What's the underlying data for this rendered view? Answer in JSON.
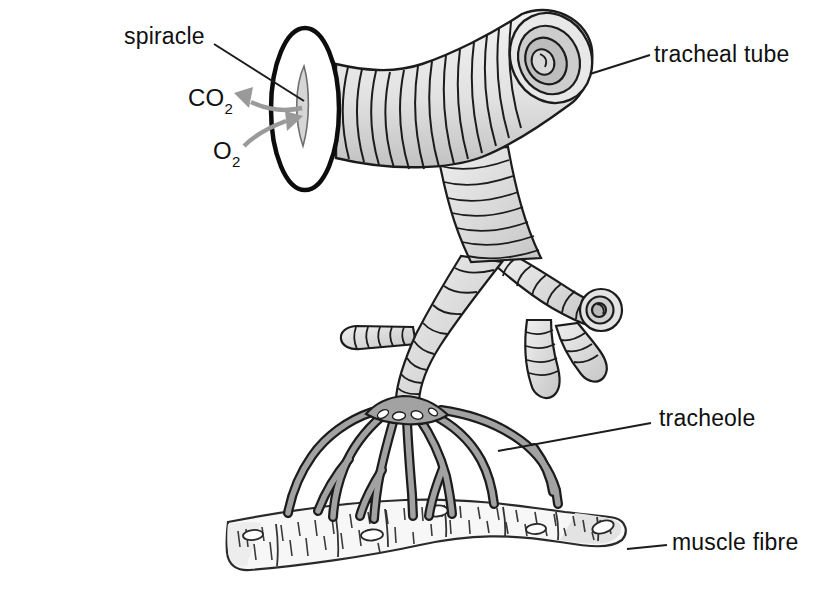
{
  "figure": {
    "labels": {
      "spiracle": "spiracle",
      "tracheal_tube": "tracheal tube",
      "tracheole": "tracheole",
      "muscle_fibre": "muscle fibre"
    },
    "gases": {
      "co2": {
        "symbol": "CO",
        "subscript": "2"
      },
      "o2": {
        "symbol": "O",
        "subscript": "2"
      }
    },
    "colors": {
      "background": "#ffffff",
      "outline": "#1c1c1c",
      "tube_light": "#f1f1f1",
      "tube_dark": "#c4c4c4",
      "tracheole_fill": "#a2a2a2",
      "arrow_gray": "#9a9a9a",
      "muscle_fill": "#f7f7f7"
    }
  }
}
